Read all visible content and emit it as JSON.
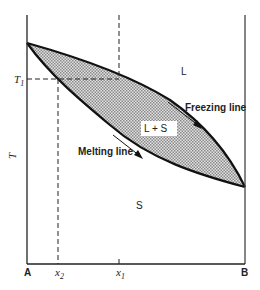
{
  "diagram": {
    "type": "binary phase diagram (solid solution)",
    "axis_labels": {
      "y": "T",
      "x_left": "A",
      "x_right": "B"
    },
    "ticks": {
      "t1": "T",
      "t1_sub": "1",
      "x1": "x",
      "x1_sub": "1",
      "x2": "x",
      "x2_sub": "2"
    },
    "regions": {
      "liquid": "L",
      "two_phase": "L + S",
      "solid": "S"
    },
    "curves": {
      "freezing": "Freezing line",
      "melting": "Melting line"
    },
    "colors": {
      "line": "#111111",
      "fill": "#c8c8c8"
    }
  }
}
